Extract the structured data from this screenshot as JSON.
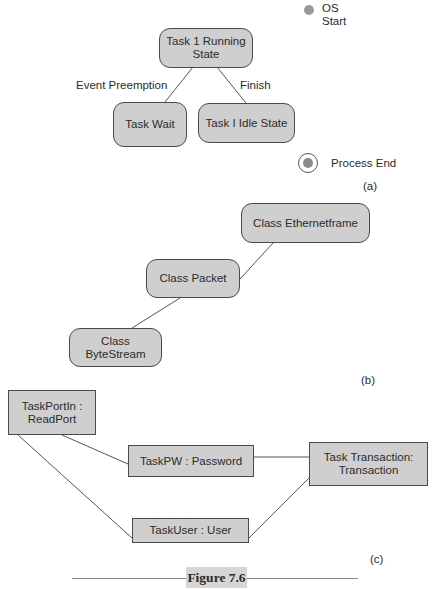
{
  "figure": {
    "caption": "Figure 7.6",
    "panel_a": {
      "tag": "(a)",
      "start": {
        "label_line1": "OS",
        "label_line2": "Start"
      },
      "end": {
        "label": "Process End"
      },
      "nodes": [
        {
          "id": "running",
          "line1": "Task 1 Running",
          "line2": "State"
        },
        {
          "id": "wait",
          "line1": "Task Wait"
        },
        {
          "id": "idle",
          "line1": "Task I Idle State"
        }
      ],
      "edges": [
        {
          "from": "running",
          "to": "wait",
          "label": "Event Preemption"
        },
        {
          "from": "running",
          "to": "idle",
          "label": "Finish"
        }
      ]
    },
    "panel_b": {
      "tag": "(b)",
      "nodes": [
        {
          "id": "ethernet",
          "line1": "Class Ethernetframe"
        },
        {
          "id": "packet",
          "line1": "Class Packet"
        },
        {
          "id": "bytestream",
          "line1": "Class ByteStream"
        }
      ],
      "edges": [
        {
          "from": "ethernet",
          "to": "packet"
        },
        {
          "from": "packet",
          "to": "bytestream"
        }
      ]
    },
    "panel_c": {
      "tag": "(c)",
      "nodes": [
        {
          "id": "portin",
          "line1": "TaskPortIn :",
          "line2": "ReadPort"
        },
        {
          "id": "pw",
          "line1": "TaskPW : Password"
        },
        {
          "id": "transaction",
          "line1": "Task Transaction:",
          "line2": "Transaction"
        },
        {
          "id": "user",
          "line1": "TaskUser : User"
        }
      ],
      "edges": [
        {
          "from": "portin",
          "to": "pw"
        },
        {
          "from": "portin",
          "to": "user"
        },
        {
          "from": "pw",
          "to": "transaction"
        },
        {
          "from": "user",
          "to": "transaction"
        }
      ]
    }
  }
}
